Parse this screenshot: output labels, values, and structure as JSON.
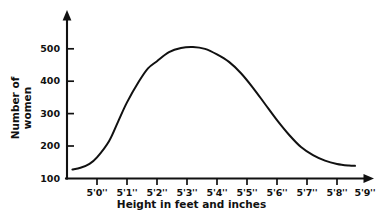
{
  "chart_data": {
    "type": "line",
    "title": "",
    "subtitle": "",
    "xlabel": "Height in feet and inches",
    "ylabel_lines": [
      "Number of",
      "women"
    ],
    "ylabel": "Number of women",
    "grid": false,
    "legend": false,
    "legend_position": "none",
    "xlim": [
      0,
      10
    ],
    "ylim": [
      100,
      560
    ],
    "x_tick_labels": [
      "5'0''",
      "5'1''",
      "5'2''",
      "5'3''",
      "5'4''",
      "5'5''",
      "5'6''",
      "5'7''",
      "5'8''",
      "5'9''"
    ],
    "y_tick_labels": [
      "100",
      "200",
      "300",
      "400",
      "500"
    ],
    "y_tick_values": [
      100,
      200,
      300,
      400,
      500
    ],
    "categories": [
      "5'0''",
      "5'1''",
      "5'2''",
      "5'3''",
      "5'4''",
      "5'5''",
      "5'6''",
      "5'7''",
      "5'8''",
      "5'9''"
    ],
    "values": [
      165,
      335,
      460,
      505,
      505,
      450,
      345,
      225,
      160,
      140
    ],
    "series": [
      {
        "name": "Number of women",
        "values": [
          165,
          335,
          460,
          505,
          505,
          450,
          345,
          225,
          160,
          140
        ],
        "color": "#111111"
      }
    ],
    "curve_points": [
      {
        "x": 0.18,
        "y": 128
      },
      {
        "x": 0.45,
        "y": 133
      },
      {
        "x": 0.75,
        "y": 145
      },
      {
        "x": 1.0,
        "y": 165
      },
      {
        "x": 1.4,
        "y": 215
      },
      {
        "x": 1.7,
        "y": 275
      },
      {
        "x": 2.0,
        "y": 335
      },
      {
        "x": 2.4,
        "y": 400
      },
      {
        "x": 2.7,
        "y": 440
      },
      {
        "x": 3.0,
        "y": 462
      },
      {
        "x": 3.4,
        "y": 490
      },
      {
        "x": 3.8,
        "y": 503
      },
      {
        "x": 4.2,
        "y": 506
      },
      {
        "x": 4.6,
        "y": 500
      },
      {
        "x": 5.0,
        "y": 483
      },
      {
        "x": 5.4,
        "y": 460
      },
      {
        "x": 5.8,
        "y": 425
      },
      {
        "x": 6.2,
        "y": 380
      },
      {
        "x": 6.6,
        "y": 330
      },
      {
        "x": 7.0,
        "y": 280
      },
      {
        "x": 7.4,
        "y": 235
      },
      {
        "x": 7.8,
        "y": 197
      },
      {
        "x": 8.2,
        "y": 172
      },
      {
        "x": 8.6,
        "y": 155
      },
      {
        "x": 9.0,
        "y": 145
      },
      {
        "x": 9.4,
        "y": 140
      },
      {
        "x": 9.6,
        "y": 139
      }
    ],
    "peak": {
      "x_label": "5'3''-5'4''",
      "value": 505
    },
    "axis_arrows": {
      "x": true,
      "y": true
    },
    "colors": {
      "curve": "#111111",
      "axis": "#111111",
      "background": "#ffffff",
      "text": "#111111"
    }
  }
}
